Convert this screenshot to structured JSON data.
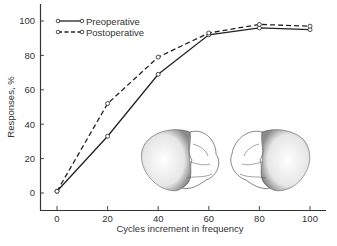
{
  "chart_data": {
    "type": "line",
    "title": "",
    "xlabel": "Cycles increment in frequency",
    "ylabel": "Responses, %",
    "x": [
      0,
      20,
      40,
      60,
      80,
      100
    ],
    "xticks": [
      "0",
      "20",
      "40",
      "60",
      "80",
      "100"
    ],
    "yticks": [
      "0",
      "20",
      "40",
      "60",
      "80",
      "100"
    ],
    "xlim": [
      -8,
      104
    ],
    "ylim": [
      -10,
      110
    ],
    "grid": false,
    "legend_position": "upper-left",
    "series": [
      {
        "name": "Preoperative",
        "style": "solid",
        "marker": "open-circle",
        "values": [
          1,
          33,
          69,
          92,
          96,
          95
        ]
      },
      {
        "name": "Postoperative",
        "style": "dashed",
        "marker": "open-circle",
        "values": [
          1,
          52,
          79,
          93,
          98,
          97
        ]
      }
    ],
    "annotations": [
      "Illustration: two brain hemisphere drawings (lateral views) with shaded lesion areas"
    ]
  },
  "legend": {
    "items": [
      {
        "label": "Preoperative"
      },
      {
        "label": "Postoperative"
      }
    ]
  },
  "colors": {
    "line": "#222222",
    "axis": "#333333",
    "background": "#ffffff"
  }
}
